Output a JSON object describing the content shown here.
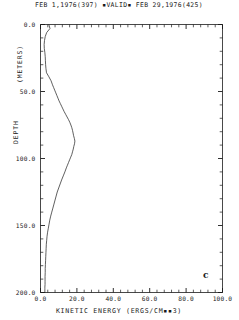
{
  "header": {
    "start_date": "FEB  1,1976(397)",
    "valid_marker": "▪VALID▪",
    "end_date": "FEB 29,1976(425)",
    "full_text": "FEB  1,1976(397) ▪VALID▪ FEB 29,1976(425)"
  },
  "panel": {
    "label": "c"
  },
  "axes": {
    "x_label": "KINETIC ENERGY  (ERGS/CM▪▪3)",
    "y_label_top": "(METERS)",
    "y_label_bottom": "DEPTH",
    "y_label_full": "DEPTH  (METERS)",
    "x_ticklabels": [
      "0.0",
      "20.0",
      "40.0",
      "60.0",
      "80.0",
      "100.0"
    ],
    "y_ticklabels": [
      "0.0",
      "50.0",
      "100.0",
      "150.0",
      "200.0"
    ]
  },
  "colors": {
    "ink": "#1a1a1a",
    "curve": "#2b2b2b",
    "background": "#ffffff"
  },
  "chart_data": {
    "type": "line",
    "title": "FEB  1,1976(397) ▪VALID▪ FEB 29,1976(425)",
    "xlabel": "KINETIC ENERGY  (ERGS/CM**3)",
    "ylabel": "DEPTH (METERS)",
    "xlim": [
      0.0,
      100.0
    ],
    "ylim": [
      200.0,
      0.0
    ],
    "y_inverted": true,
    "grid": false,
    "legend": null,
    "xticks": [
      0.0,
      20.0,
      40.0,
      60.0,
      80.0,
      100.0
    ],
    "yticks": [
      0.0,
      50.0,
      100.0,
      150.0,
      200.0
    ],
    "x_minor_interval": 4.0,
    "y_minor_interval": 10.0,
    "series": [
      {
        "name": "kinetic energy profile",
        "x": [
          4.6,
          5.2,
          3.4,
          2.6,
          2.2,
          2.0,
          2.1,
          2.4,
          2.6,
          2.7,
          2.8,
          3.0,
          3.3,
          4.6,
          5.8,
          6.6,
          7.2,
          7.8,
          8.4,
          9.0,
          9.6,
          10.2,
          10.9,
          11.6,
          12.3,
          13.0,
          13.8,
          14.6,
          15.4,
          16.1,
          16.7,
          17.2,
          17.6,
          17.9,
          18.2,
          18.6,
          18.9,
          18.7,
          18.3,
          18.0,
          17.6,
          17.2,
          16.6,
          16.0,
          15.4,
          14.8,
          14.2,
          13.4,
          12.5,
          11.6,
          10.8,
          10.0,
          9.2,
          8.6,
          8.0,
          7.4,
          6.8,
          6.2,
          5.6,
          5.1,
          4.7,
          4.3,
          3.9,
          3.6,
          3.4,
          3.2,
          3.1,
          3.0,
          2.9,
          2.8,
          2.7,
          2.6,
          2.6,
          2.5,
          2.5,
          2.5,
          2.5,
          2.4,
          2.4,
          2.4,
          2.4
        ],
        "y": [
          0,
          3,
          6,
          9,
          12,
          15,
          18,
          21,
          24,
          27,
          30,
          33,
          36,
          39,
          42,
          45,
          47,
          49,
          51,
          53,
          55,
          57,
          59,
          61,
          63,
          65,
          67,
          69,
          71,
          73,
          75,
          77,
          79,
          81,
          83,
          85,
          87,
          89,
          91,
          93,
          95,
          97,
          99,
          101,
          103,
          105,
          107,
          110,
          113,
          116,
          119,
          122,
          125,
          128,
          131,
          134,
          137,
          140,
          143,
          146,
          149,
          152,
          155,
          158,
          161,
          164,
          167,
          170,
          173,
          176,
          179,
          182,
          185,
          188,
          190,
          192,
          194,
          196,
          197,
          198,
          200
        ]
      }
    ]
  }
}
